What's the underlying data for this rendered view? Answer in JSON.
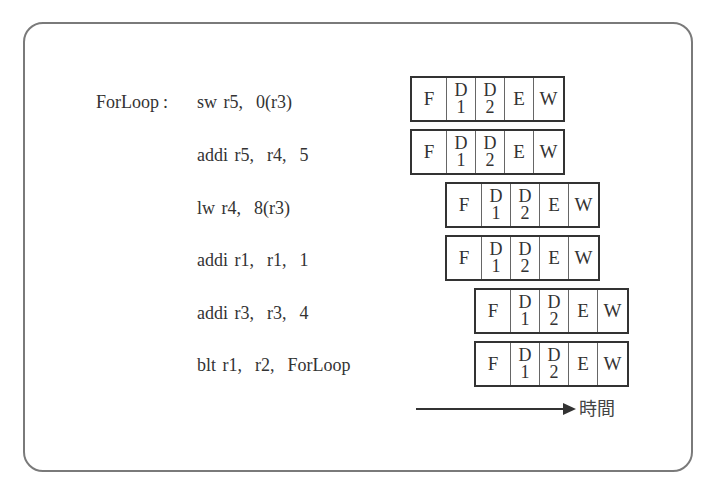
{
  "diagram": {
    "title": "",
    "loop_label": "ForLoop",
    "colon": ":",
    "instructions": [
      {
        "text": "sw r5,  0(r3)"
      },
      {
        "text": "addi r5,  r4,  5"
      },
      {
        "text": "lw r4,  8(r3)"
      },
      {
        "text": "addi r1,  r1,  1"
      },
      {
        "text": "addi r3,  r3,  4"
      },
      {
        "text": "blt r1,  r2,  ForLoop"
      }
    ],
    "stages": {
      "f": "F",
      "d1_top": "D",
      "d1_bottom": "1",
      "d2_top": "D",
      "d2_bottom": "2",
      "e": "E",
      "w": "W"
    },
    "pipeline_rows": [
      {
        "instruction": "sw r5, 0(r3)",
        "start_cycle": 0
      },
      {
        "instruction": "addi r5, r4, 5",
        "start_cycle": 0
      },
      {
        "instruction": "lw r4, 8(r3)",
        "start_cycle": 1
      },
      {
        "instruction": "addi r1, r1, 1",
        "start_cycle": 1
      },
      {
        "instruction": "addi r3, r3, 4",
        "start_cycle": 2
      },
      {
        "instruction": "blt r1, r2, ForLoop",
        "start_cycle": 2
      }
    ],
    "time_axis_label": "時間"
  }
}
